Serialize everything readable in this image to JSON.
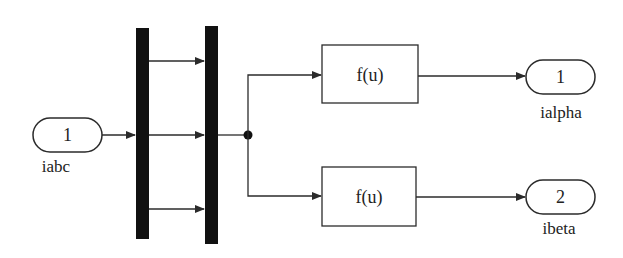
{
  "diagram": {
    "type": "simulink-block-diagram",
    "colors": {
      "line": "#2b2b2b",
      "bar": "#111111",
      "background": "#ffffff"
    },
    "inports": [
      {
        "number": "1",
        "name": "iabc"
      }
    ],
    "demux": {
      "outputs": 3
    },
    "mux": {
      "inputs": 3
    },
    "fcn_blocks": [
      {
        "label": "f(u)"
      },
      {
        "label": "f(u)"
      }
    ],
    "outports": [
      {
        "number": "1",
        "name": "ialpha"
      },
      {
        "number": "2",
        "name": "ibeta"
      }
    ]
  }
}
